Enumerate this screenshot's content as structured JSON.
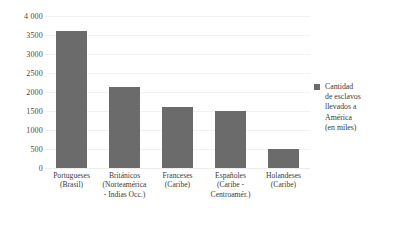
{
  "chart_data": {
    "type": "bar",
    "title": "",
    "xlabel": "",
    "ylabel": "",
    "ylim": [
      0,
      4000
    ],
    "ytick_step": 500,
    "grid": true,
    "legend_position": "right",
    "categories": [
      "Portugueses\n(Brasil)",
      "Británicos\n(Norteamérica\n- Indias Occ.)",
      "Franceses\n(Caribe)",
      "Españoles\n(Caribe -\nCentroamér.)",
      "Holandeses\n(Caribe)"
    ],
    "category_lines": [
      [
        "Portugueses",
        "(Brasil)"
      ],
      [
        "Británicos",
        "(Norteamérica",
        "- Indias Occ.)"
      ],
      [
        "Franceses",
        "(Caribe)"
      ],
      [
        "Españoles",
        "(Caribe -",
        "Centroamér.)"
      ],
      [
        "Holandeses",
        "(Caribe)"
      ]
    ],
    "values": [
      3600,
      2120,
      1600,
      1500,
      500
    ],
    "series": [
      {
        "name": "Cantidad de esclavos llevados a América (en miles)",
        "values": [
          3600,
          2120,
          1600,
          1500,
          500
        ]
      }
    ],
    "ytick_labels": [
      "4 000",
      "3500",
      "3000",
      "2500",
      "2000",
      "1500",
      "1000",
      "500",
      "0"
    ],
    "ytick_values": [
      4000,
      3500,
      3000,
      2500,
      2000,
      1500,
      1000,
      500,
      0
    ],
    "bar_color": "#6b6b6b",
    "grid_color": "#f2f2f2",
    "background_color": "#ffffff"
  },
  "legend": {
    "swatch_color": "#6b6b6b",
    "lines": [
      "Cantidad",
      "de esclavos",
      "llevados a",
      "América",
      "(en miles)"
    ]
  }
}
